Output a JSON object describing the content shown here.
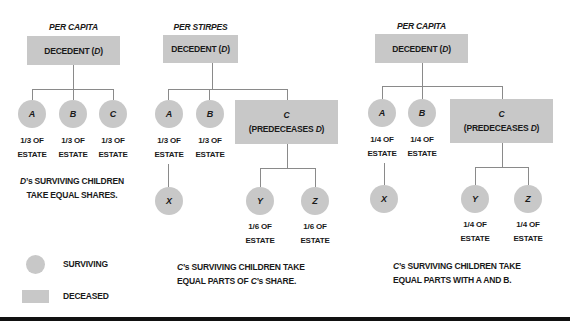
{
  "diagrams": [
    {
      "title": "PER CAPITA",
      "decedent": {
        "label": "DECEDENT (",
        "var": "D",
        "close": ")"
      },
      "children": [
        {
          "name": "A",
          "share": [
            "1/3 OF",
            "ESTATE"
          ]
        },
        {
          "name": "B",
          "share": [
            "1/3 OF",
            "ESTATE"
          ]
        },
        {
          "name": "C",
          "share": [
            "1/3 OF",
            "ESTATE"
          ]
        }
      ],
      "caption": {
        "var": "D",
        "lines": [
          "’s SURVIVING CHILDREN",
          "TAKE EQUAL SHARES."
        ]
      }
    },
    {
      "title": "PER STIRPES",
      "decedent": {
        "label": "DECEDENT (",
        "var": "D",
        "close": ")"
      },
      "children": [
        {
          "name": "A",
          "share": [
            "1/3 OF",
            "ESTATE"
          ]
        },
        {
          "name": "B",
          "share": [
            "1/3 OF",
            "ESTATE"
          ]
        },
        {
          "name": "C",
          "status": "(PREDECEASES ",
          "status_var": "D",
          "status_close": ")"
        }
      ],
      "grandchildren": [
        {
          "name": "X"
        },
        {
          "name": "Y",
          "share": [
            "1/6 OF",
            "ESTATE"
          ]
        },
        {
          "name": "Z",
          "share": [
            "1/6 OF",
            "ESTATE"
          ]
        }
      ],
      "caption": {
        "var": "C",
        "line1_rest": "’s SURVIVING CHILDREN TAKE",
        "line2_pre": "EQUAL PARTS OF ",
        "line2_var": "C",
        "line2_rest": "’s SHARE."
      }
    },
    {
      "title": "PER CAPITA",
      "decedent": {
        "label": "DECEDENT (",
        "var": "D",
        "close": ")"
      },
      "children": [
        {
          "name": "A",
          "share": [
            "1/4 OF",
            "ESTATE"
          ]
        },
        {
          "name": "B",
          "share": [
            "1/4 OF",
            "ESTATE"
          ]
        },
        {
          "name": "C",
          "status": "(PREDECEASES ",
          "status_var": "D",
          "status_close": ")"
        }
      ],
      "grandchildren": [
        {
          "name": "X"
        },
        {
          "name": "Y",
          "share": [
            "1/4 OF",
            "ESTATE"
          ]
        },
        {
          "name": "Z",
          "share": [
            "1/4 OF",
            "ESTATE"
          ]
        }
      ],
      "caption": {
        "var": "C",
        "line1_rest": "’s SURVIVING CHILDREN TAKE",
        "line2": "EQUAL PARTS WITH A AND B."
      }
    }
  ],
  "legend": {
    "surviving": "SURVIVING",
    "deceased": "DECEASED"
  },
  "colors": {
    "node_fill": "#c8c8c8",
    "connector": "#8a8a8a",
    "rule": "#111111"
  }
}
